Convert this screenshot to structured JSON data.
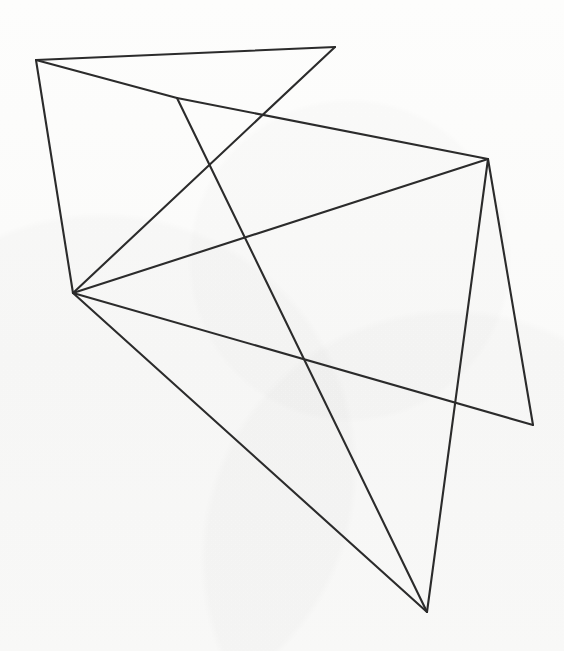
{
  "canvas": {
    "width": 564,
    "height": 651,
    "background_color": "#fbfbfa",
    "description": "Hand-drawn geometric line figure: a non-convex polygonal network of straight line segments forming interlocking triangles on blank paper"
  },
  "style": {
    "stroke_color": "#2b2b2b",
    "stroke_width": 2.1,
    "line_cap": "round",
    "fill": "none"
  },
  "figure": {
    "vertex_count": 7,
    "edge_count": 10,
    "vertices": [
      {
        "id": "A",
        "label": "top-left",
        "x": 36,
        "y": 60,
        "degree": 3
      },
      {
        "id": "B",
        "label": "top-apex",
        "x": 335,
        "y": 47,
        "degree": 2
      },
      {
        "id": "C",
        "label": "upper-mid-junction",
        "x": 177,
        "y": 98,
        "degree": 3
      },
      {
        "id": "D",
        "label": "left-hub",
        "x": 73,
        "y": 293,
        "degree": 5
      },
      {
        "id": "E",
        "label": "right-peak",
        "x": 488,
        "y": 159,
        "degree": 4
      },
      {
        "id": "F",
        "label": "lower-right",
        "x": 533,
        "y": 425,
        "degree": 2
      },
      {
        "id": "G",
        "label": "bottom-apex",
        "x": 427,
        "y": 612,
        "degree": 3
      }
    ],
    "edges": [
      {
        "id": "e1",
        "from": "A",
        "to": "B",
        "x1": 36,
        "y1": 60,
        "x2": 335,
        "y2": 47
      },
      {
        "id": "e2",
        "from": "A",
        "to": "C",
        "x1": 36,
        "y1": 60,
        "x2": 177,
        "y2": 98
      },
      {
        "id": "e3",
        "from": "C",
        "to": "E",
        "x1": 177,
        "y1": 98,
        "x2": 488,
        "y2": 159
      },
      {
        "id": "e4",
        "from": "A",
        "to": "D",
        "x1": 36,
        "y1": 60,
        "x2": 73,
        "y2": 293
      },
      {
        "id": "e5",
        "from": "B",
        "to": "D",
        "x1": 335,
        "y1": 47,
        "x2": 73,
        "y2": 293
      },
      {
        "id": "e6",
        "from": "D",
        "to": "E",
        "x1": 73,
        "y1": 293,
        "x2": 488,
        "y2": 159
      },
      {
        "id": "e7",
        "from": "D",
        "to": "F",
        "x1": 73,
        "y1": 293,
        "x2": 533,
        "y2": 425
      },
      {
        "id": "e8",
        "from": "D",
        "to": "G",
        "x1": 73,
        "y1": 293,
        "x2": 427,
        "y2": 612
      },
      {
        "id": "e9",
        "from": "C",
        "to": "G",
        "x1": 177,
        "y1": 98,
        "x2": 427,
        "y2": 612
      },
      {
        "id": "e10",
        "from": "E",
        "to": "F",
        "x1": 488,
        "y1": 159,
        "x2": 533,
        "y2": 425
      },
      {
        "id": "e11",
        "from": "E",
        "to": "G",
        "x1": 488,
        "y1": 159,
        "x2": 427,
        "y2": 612
      }
    ]
  }
}
